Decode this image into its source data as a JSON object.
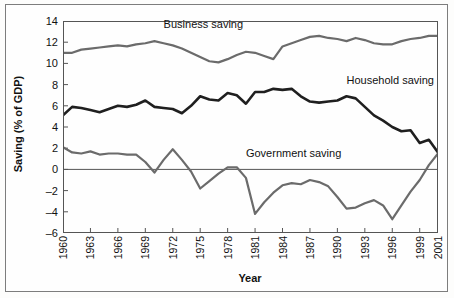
{
  "chart_data": {
    "type": "line",
    "title": "",
    "xlabel": "Year",
    "ylabel": "Saving (% of GDP)",
    "xlim": [
      1960,
      2001
    ],
    "ylim": [
      -6,
      14
    ],
    "yticks": [
      14,
      12,
      10,
      8,
      6,
      4,
      2,
      0,
      -2,
      -4,
      -6
    ],
    "ytick_labels": [
      "14",
      "12",
      "10",
      "8",
      "6",
      "4",
      "2",
      "0",
      "–2",
      "–4",
      "–6"
    ],
    "xticks": [
      1960,
      1963,
      1966,
      1969,
      1972,
      1975,
      1978,
      1981,
      1984,
      1987,
      1990,
      1993,
      1996,
      1999,
      2001
    ],
    "xtick_labels": [
      "1960",
      "1963",
      "1966",
      "1969",
      "1972",
      "1975",
      "1978",
      "1981",
      "1984",
      "1987",
      "1990",
      "1993",
      "1996",
      "1999",
      "2001"
    ],
    "grid": false,
    "zero_line": 0,
    "legend": "inline-annotations",
    "x": [
      1960,
      1961,
      1962,
      1963,
      1964,
      1965,
      1966,
      1967,
      1968,
      1969,
      1970,
      1971,
      1972,
      1973,
      1974,
      1975,
      1976,
      1977,
      1978,
      1979,
      1980,
      1981,
      1982,
      1983,
      1984,
      1985,
      1986,
      1987,
      1988,
      1989,
      1990,
      1991,
      1992,
      1993,
      1994,
      1995,
      1996,
      1997,
      1998,
      1999,
      2000,
      2001
    ],
    "series": [
      {
        "name": "Business saving",
        "color": "#6b6b6b",
        "width": 2.2,
        "label": "Business saving",
        "values": [
          11.0,
          11.0,
          11.3,
          11.4,
          11.5,
          11.6,
          11.7,
          11.6,
          11.8,
          11.9,
          12.1,
          11.9,
          11.7,
          11.4,
          11.0,
          10.6,
          10.2,
          10.1,
          10.4,
          10.8,
          11.1,
          11.0,
          10.7,
          10.4,
          11.6,
          11.9,
          12.2,
          12.5,
          12.6,
          12.4,
          12.3,
          12.1,
          12.4,
          12.2,
          11.9,
          11.8,
          11.8,
          12.1,
          12.3,
          12.4,
          12.6,
          12.6
        ]
      },
      {
        "name": "Household saving",
        "color": "#1f1f1f",
        "width": 2.6,
        "label": "Household saving",
        "values": [
          5.1,
          5.9,
          5.8,
          5.6,
          5.4,
          5.7,
          6.0,
          5.9,
          6.1,
          6.5,
          5.9,
          5.8,
          5.7,
          5.3,
          6.0,
          6.9,
          6.6,
          6.5,
          7.2,
          7.0,
          6.2,
          7.3,
          7.3,
          7.6,
          7.5,
          7.6,
          6.9,
          6.4,
          6.3,
          6.4,
          6.5,
          6.9,
          6.7,
          5.9,
          5.1,
          4.6,
          4.0,
          3.6,
          3.7,
          2.5,
          2.8,
          1.6
        ]
      },
      {
        "name": "Government saving",
        "color": "#6b6b6b",
        "width": 2.2,
        "label": "Government saving",
        "values": [
          2.1,
          1.6,
          1.5,
          1.7,
          1.4,
          1.5,
          1.5,
          1.4,
          1.4,
          0.7,
          -0.3,
          0.9,
          1.9,
          0.9,
          -0.2,
          -1.8,
          -1.1,
          -0.4,
          0.2,
          0.2,
          -0.8,
          -4.2,
          -3.1,
          -2.2,
          -1.5,
          -1.3,
          -1.4,
          -1.0,
          -1.2,
          -1.6,
          -2.6,
          -3.7,
          -3.6,
          -3.2,
          -2.9,
          -3.4,
          -4.7,
          -3.4,
          -2.1,
          -1.0,
          0.4,
          1.5
        ]
      }
    ],
    "annotations": [
      {
        "text": "Business saving",
        "x": 1971,
        "y": 13.6
      },
      {
        "text": "Household saving",
        "x": 1991,
        "y": 8.3
      },
      {
        "text": "Government saving",
        "x": 1980,
        "y": 1.5
      }
    ]
  },
  "axes": {
    "xlabel": "Year",
    "ylabel": "Saving (% of GDP)"
  }
}
